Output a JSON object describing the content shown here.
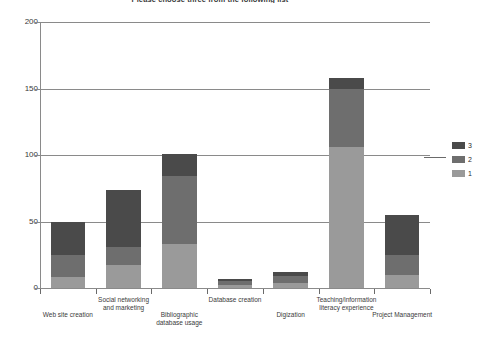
{
  "chart_data": {
    "type": "bar",
    "stacked": true,
    "title": "Please choose three from the following list",
    "xlabel": "",
    "ylabel": "",
    "ylim": [
      0,
      200
    ],
    "yticks": [
      0,
      50,
      100,
      150,
      200
    ],
    "grid": true,
    "legend_position": "right",
    "categories": [
      "Web site creation",
      "Social networking\nand marketing",
      "Bibliographic\ndatabase usage",
      "Database creation",
      "Digization",
      "Teaching/information\nliteracy experience",
      "Project Management"
    ],
    "series": [
      {
        "name": "1",
        "color": "#9a9a9a",
        "values": [
          8,
          17,
          33,
          2,
          4,
          106,
          10
        ]
      },
      {
        "name": "2",
        "color": "#6e6e6e",
        "values": [
          17,
          14,
          51,
          3,
          5,
          44,
          15
        ]
      },
      {
        "name": "3",
        "color": "#4a4a4a",
        "values": [
          25,
          43,
          17,
          2,
          3,
          8,
          30
        ]
      }
    ],
    "totals": [
      50,
      74,
      101,
      7,
      12,
      158,
      55
    ]
  },
  "legend": {
    "items": [
      {
        "label": "3",
        "color": "#4a4a4a"
      },
      {
        "label": "2",
        "color": "#6e6e6e"
      },
      {
        "label": "1",
        "color": "#9a9a9a"
      }
    ]
  },
  "axis": {
    "y_tick_labels": [
      "200",
      "150",
      "100",
      "50",
      "0"
    ]
  }
}
